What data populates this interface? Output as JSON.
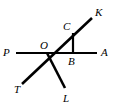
{
  "figure": {
    "background_color": "#ffffff",
    "stroke_color": "#000000",
    "width": 114,
    "height": 109
  },
  "points": {
    "P": {
      "label": "P",
      "x": 16,
      "y": 53
    },
    "A": {
      "label": "A",
      "x": 97,
      "y": 53
    },
    "T": {
      "label": "T",
      "x": 22,
      "y": 84
    },
    "K": {
      "label": "K",
      "x": 92,
      "y": 18
    },
    "L": {
      "label": "L",
      "x": 65,
      "y": 88
    },
    "O": {
      "label": "O",
      "x": 47,
      "y": 53
    },
    "B": {
      "label": "B",
      "x": 73,
      "y": 53
    },
    "C": {
      "label": "C",
      "x": 73,
      "y": 33
    }
  },
  "segments": [
    {
      "name": "line-PA",
      "from": "P",
      "to": "A",
      "stroke_width": 2.2
    },
    {
      "name": "line-TK",
      "from": "T",
      "to": "K",
      "stroke_width": 2.6
    },
    {
      "name": "ray-OL",
      "from": "O",
      "to": "L",
      "stroke_width": 2.6
    },
    {
      "name": "segment-CB",
      "from": "C",
      "to": "B",
      "stroke_width": 2.2
    }
  ],
  "labels": [
    {
      "name": "label-P",
      "text": "P",
      "x": 3,
      "y": 47
    },
    {
      "name": "label-A",
      "text": "A",
      "x": 101,
      "y": 47
    },
    {
      "name": "label-K",
      "text": "K",
      "x": 95,
      "y": 7
    },
    {
      "name": "label-T",
      "text": "T",
      "x": 14,
      "y": 84
    },
    {
      "name": "label-L",
      "text": "L",
      "x": 63,
      "y": 93
    },
    {
      "name": "label-O",
      "text": "O",
      "x": 40,
      "y": 40
    },
    {
      "name": "label-B",
      "text": "B",
      "x": 68,
      "y": 56
    },
    {
      "name": "label-C",
      "text": "C",
      "x": 63,
      "y": 21
    }
  ]
}
